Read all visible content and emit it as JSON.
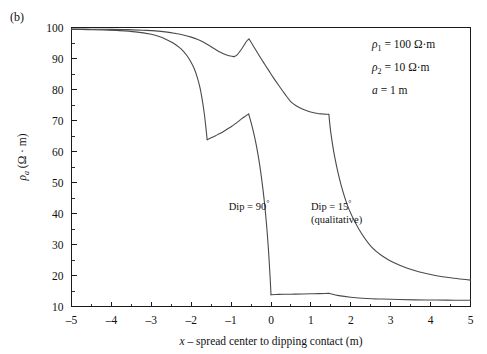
{
  "panel": {
    "label": "(b)"
  },
  "chart_data": {
    "type": "line",
    "title": "",
    "xlabel": "x – spread center to dipping contact (m)",
    "ylabel_rho": "ρ",
    "ylabel_sub": "a",
    "ylabel_units": "(Ω · m)",
    "xlim": [
      -5,
      5
    ],
    "ylim": [
      10,
      100
    ],
    "xticks": [
      -5,
      -4,
      -3,
      -2,
      -1,
      0,
      1,
      2,
      3,
      4,
      5
    ],
    "xticklabels": [
      "–5",
      "–4",
      "–3",
      "–2",
      "–1",
      "0",
      "1",
      "2",
      "3",
      "4",
      "5"
    ],
    "yticks": [
      10,
      20,
      30,
      40,
      50,
      60,
      70,
      80,
      90,
      100
    ],
    "yticklabels": [
      "10",
      "20",
      "30",
      "40",
      "50",
      "60",
      "70",
      "80",
      "90",
      "100"
    ],
    "grid": false,
    "legend_position": "inline-annotations",
    "series": [
      {
        "name": "Dip = 90°",
        "label_text": "Dip = 90",
        "label_degree": "°",
        "label_x": -0.55,
        "label_y": 41,
        "segments": [
          {
            "x": [
              -5.0,
              -4.6,
              -4.2,
              -3.8,
              -3.4,
              -3.0,
              -2.8,
              -2.6,
              -2.45,
              -2.3,
              -2.2,
              -2.1,
              -2.0,
              -1.92,
              -1.85,
              -1.78,
              -1.72,
              -1.67,
              -1.63,
              -1.6
            ],
            "y": [
              99.4,
              99.3,
              99.2,
              99.0,
              98.6,
              97.8,
              97.1,
              96.0,
              95.0,
              93.6,
              92.4,
              90.8,
              88.7,
              86.6,
              84.0,
              80.6,
              76.4,
              72.0,
              67.5,
              63.8
            ]
          },
          {
            "x": [
              -1.6,
              -1.5,
              -1.4,
              -1.3,
              -1.2,
              -1.1,
              -1.0,
              -0.9,
              -0.8,
              -0.72,
              -0.65,
              -0.6,
              -0.56
            ],
            "y": [
              63.8,
              64.4,
              65.0,
              65.7,
              66.4,
              67.2,
              68.0,
              68.9,
              69.9,
              70.7,
              71.3,
              71.8,
              72.1
            ]
          },
          {
            "x": [
              -0.56,
              -0.5,
              -0.44,
              -0.38,
              -0.32,
              -0.26,
              -0.2,
              -0.15,
              -0.1,
              -0.06,
              -0.03,
              -0.01,
              0.0
            ],
            "y": [
              72.1,
              69.4,
              66.3,
              62.8,
              58.6,
              53.6,
              47.6,
              41.8,
              34.6,
              27.6,
              21.2,
              16.4,
              13.8
            ]
          },
          {
            "x": [
              0.0,
              0.2,
              0.4,
              0.6,
              0.8,
              1.0,
              1.2,
              1.35,
              1.45
            ],
            "y": [
              13.8,
              13.9,
              13.95,
              14.0,
              14.05,
              14.1,
              14.15,
              14.2,
              14.25
            ]
          },
          {
            "x": [
              1.45,
              1.7,
              2.0,
              2.4,
              2.8,
              3.2,
              3.6,
              4.0,
              4.4,
              4.7,
              5.0
            ],
            "y": [
              14.25,
              13.5,
              13.0,
              12.6,
              12.4,
              12.25,
              12.15,
              12.1,
              12.05,
              12.02,
              12.0
            ]
          }
        ]
      },
      {
        "name": "Dip = 15° (qualitative)",
        "label_text": "Dip = 15",
        "label_degree": "°",
        "label_text2": "(qualitative)",
        "label_x": 1.0,
        "label_y": 41,
        "segments": [
          {
            "x": [
              -5.0,
              -4.5,
              -4.0,
              -3.6,
              -3.2,
              -2.9,
              -2.6,
              -2.4,
              -2.2,
              -2.0,
              -1.85,
              -1.7,
              -1.55,
              -1.45,
              -1.35,
              -1.25,
              -1.15,
              -1.05,
              -0.98,
              -0.92
            ],
            "y": [
              99.5,
              99.45,
              99.4,
              99.3,
              99.1,
              98.9,
              98.5,
              98.1,
              97.6,
              96.9,
              96.2,
              95.3,
              94.2,
              93.4,
              92.6,
              91.9,
              91.3,
              90.9,
              90.7,
              90.6
            ]
          },
          {
            "x": [
              -0.92,
              -0.85,
              -0.78,
              -0.72,
              -0.66,
              -0.62,
              -0.58,
              -0.55
            ],
            "y": [
              90.6,
              91.2,
              92.3,
              93.4,
              94.6,
              95.4,
              96.0,
              96.3
            ]
          },
          {
            "x": [
              -0.55,
              -0.45,
              -0.35,
              -0.25,
              -0.15,
              -0.05,
              0.05,
              0.2,
              0.35,
              0.5,
              0.65,
              0.8,
              0.95,
              1.1,
              1.2,
              1.3,
              1.38,
              1.45
            ],
            "y": [
              96.3,
              94.2,
              92.1,
              90.0,
              88.0,
              86.0,
              84.0,
              81.2,
              78.5,
              76.0,
              74.6,
              73.6,
              72.9,
              72.4,
              72.2,
              72.1,
              72.0,
              72.0
            ]
          },
          {
            "x": [
              1.45,
              1.5,
              1.6,
              1.75,
              1.95,
              2.2,
              2.5,
              2.8,
              3.1,
              3.4,
              3.7,
              4.0,
              4.3,
              4.6,
              4.8,
              5.0
            ],
            "y": [
              72.0,
              66.0,
              58.0,
              49.5,
              41.5,
              35.0,
              29.5,
              26.2,
              24.0,
              22.4,
              21.2,
              20.3,
              19.6,
              19.1,
              18.8,
              18.5
            ]
          }
        ]
      }
    ],
    "annotations": [
      {
        "id": "rho1",
        "symbol": "ρ",
        "sub": "1",
        "eq": "=",
        "value": "100 Ω·m"
      },
      {
        "id": "rho2",
        "symbol": "ρ",
        "sub": "2",
        "eq": "=",
        "value": "10 Ω·m"
      },
      {
        "id": "a",
        "symbol": "a",
        "sub": "",
        "eq": "=",
        "value": "1 m"
      }
    ]
  },
  "colors": {
    "axis": "#1a1a1a",
    "curve": "#4a4a4a",
    "background": "#ffffff",
    "text": "#111111"
  }
}
